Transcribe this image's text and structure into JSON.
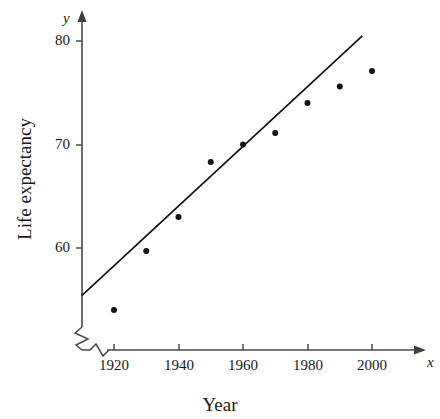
{
  "chart_data": {
    "type": "scatter",
    "title": "",
    "xlabel": "Year",
    "ylabel": "Life expectancy",
    "x_axis_symbol": "x",
    "y_axis_symbol": "y",
    "xlim": [
      1910,
      2010
    ],
    "ylim": [
      53,
      81
    ],
    "grid": false,
    "legend": null,
    "axis_break_x": true,
    "axis_break_y": true,
    "x_ticks": [
      1920,
      1940,
      1960,
      1980,
      2000
    ],
    "x_tick_labels": [
      "1920",
      "1940",
      "1960",
      "1980",
      "2000"
    ],
    "y_ticks": [
      60,
      70,
      80
    ],
    "y_tick_labels": [
      "60",
      "70",
      "80"
    ],
    "x": [
      1920,
      1930,
      1940,
      1950,
      1960,
      1970,
      1980,
      1990,
      2000
    ],
    "values": [
      54.0,
      59.7,
      63.0,
      68.3,
      70.0,
      71.1,
      74.0,
      75.6,
      77.1
    ],
    "points": [
      {
        "x": 1920,
        "y": 54.0
      },
      {
        "x": 1930,
        "y": 59.7
      },
      {
        "x": 1940,
        "y": 63.0
      },
      {
        "x": 1950,
        "y": 68.3
      },
      {
        "x": 1960,
        "y": 70.0
      },
      {
        "x": 1970,
        "y": 71.1
      },
      {
        "x": 1980,
        "y": 74.0
      },
      {
        "x": 1990,
        "y": 75.6
      },
      {
        "x": 2000,
        "y": 77.1
      },
      {
        "x": 1920,
        "y": 54.0
      }
    ],
    "trend_line": {
      "type": "line",
      "x_start": 1910,
      "y_start": 55.4,
      "x_end": 1997,
      "y_end": 80.5
    },
    "marker": {
      "shape": "circle",
      "color": "#111111",
      "size_px": 6
    },
    "line_color": "#111111",
    "axis_color": "#444444"
  },
  "labels": {
    "x_title": "Year",
    "y_title": "Life expectancy",
    "x_symbol": "x",
    "y_symbol": "y",
    "ytick_80": "80",
    "ytick_70": "70",
    "ytick_60": "60",
    "xtick_1920": "1920",
    "xtick_1940": "1940",
    "xtick_1960": "1960",
    "xtick_1980": "1980",
    "xtick_2000": "2000"
  }
}
